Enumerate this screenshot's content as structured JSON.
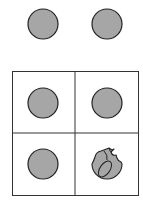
{
  "puzzle": {
    "description": "Two circles shown above a 2x2 grid; three grid cells contain whole circles, one contains a broken circle",
    "colors": {
      "fill": "#a6a6a6",
      "stroke": "#222222",
      "grid": "#333333",
      "background": "#ffffff"
    },
    "top_row": [
      {
        "shape": "circle",
        "state": "whole"
      },
      {
        "shape": "circle",
        "state": "whole"
      }
    ],
    "grid": [
      {
        "row": 1,
        "col": 1,
        "shape": "circle",
        "state": "whole"
      },
      {
        "row": 1,
        "col": 2,
        "shape": "circle",
        "state": "whole"
      },
      {
        "row": 2,
        "col": 1,
        "shape": "circle",
        "state": "whole"
      },
      {
        "row": 2,
        "col": 2,
        "shape": "circle",
        "state": "broken"
      }
    ]
  }
}
